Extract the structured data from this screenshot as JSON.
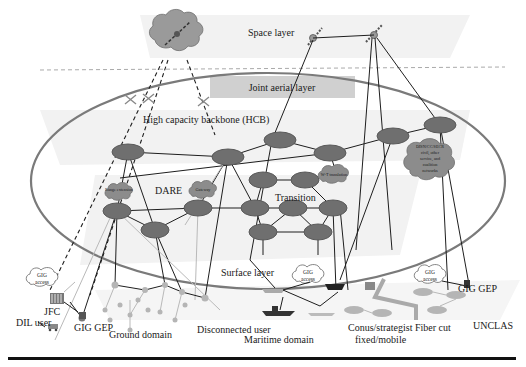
{
  "diagram": {
    "layers": {
      "space": "Space layer",
      "joint_aerial": "Joint aerial layer",
      "hcb": "High capacity backbone (HCB)",
      "surface": "Surface layer"
    },
    "regions": {
      "dare": "DARE",
      "transition": "Transition"
    },
    "clouds": {
      "range_extension": "Range extension",
      "gateway": "Gateway",
      "wt_translation": "W-T translation",
      "disn": {
        "line1": "DISN/CC/SECR",
        "line2": "civil, other",
        "line3": "service, and",
        "line4": "coalition",
        "line5": "networks"
      },
      "gig_access_1": {
        "line1": "GIG",
        "line2": "access"
      },
      "gig_access_2": {
        "line1": "GIG",
        "line2": "access"
      },
      "gig_access_3": {
        "line1": "GIG",
        "line2": "access"
      }
    },
    "labels": {
      "jfc": "JFC",
      "dil_user": "DIL user",
      "gig_gep_left": "GIG GEP",
      "ground_domain": "Ground domain",
      "disconnected_user": "Disconnected user",
      "maritime_domain": "Maritime domain",
      "conus_line1": "Conus/strategist",
      "conus_line2": "fixed/mobile",
      "fiber_cut": "Fiber cut",
      "gig_gep_right": "GIG GEP",
      "unclas": "UNCLAS"
    },
    "colors": {
      "node_fill": "#6f6f6f",
      "ellipse_stroke": "#7a7a7a",
      "band_fill": "#f2f2f2",
      "aerial_box": "#d0d0d0",
      "bottom_rule": "#111111"
    }
  }
}
